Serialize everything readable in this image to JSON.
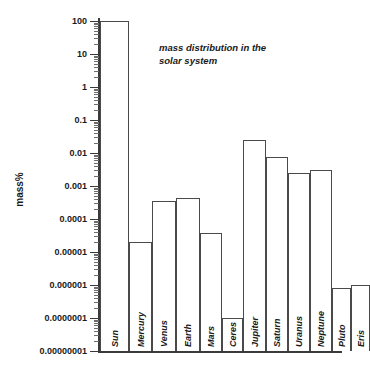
{
  "chart_data": {
    "type": "bar",
    "title": "mass distribution in the solar system",
    "title_line1": "mass distribution in the",
    "title_line2": "solar system",
    "xlabel": "",
    "ylabel": "mass%",
    "yscale": "log",
    "ylim": [
      1e-08,
      100
    ],
    "grid": false,
    "legend": "none",
    "ytick_labels": [
      "100",
      "10",
      "1",
      "0.1",
      "0.01",
      "0.001",
      "0.0001",
      "0.00001",
      "0.000001",
      "0.0000001",
      "0.00000001"
    ],
    "ytick_values": [
      100,
      10,
      1,
      0.1,
      0.01,
      0.001,
      0.0001,
      1e-05,
      1e-06,
      1e-07,
      1e-08
    ],
    "categories": [
      "Sun",
      "Mercury",
      "Venus",
      "Earth",
      "Mars",
      "Ceres",
      "Jupiter",
      "Saturn",
      "Uranus",
      "Neptune",
      "Pluto",
      "Eris"
    ],
    "values": [
      100,
      1.7e-05,
      0.00025,
      0.0003,
      3.2e-05,
      4.7e-07,
      0.095,
      0.028,
      0.0044,
      0.0052,
      7e-07,
      9e-07
    ],
    "bars": [
      {
        "label": "Sun",
        "value": 100,
        "left": 100,
        "width": 29,
        "top": 21
      },
      {
        "label": "Mercury",
        "value": 1.7e-05,
        "left": 129,
        "width": 23,
        "top": 242
      },
      {
        "label": "Venus",
        "value": 0.00025,
        "left": 152,
        "width": 24,
        "top": 201
      },
      {
        "label": "Earth",
        "value": 0.0003,
        "left": 176,
        "width": 24,
        "top": 198
      },
      {
        "label": "Mars",
        "value": 3.2e-05,
        "left": 200,
        "width": 22,
        "top": 233
      },
      {
        "label": "Ceres",
        "value": 4.7e-07,
        "left": 222,
        "width": 21,
        "top": 318
      },
      {
        "label": "Jupiter",
        "value": 0.095,
        "left": 243,
        "width": 23,
        "top": 140
      },
      {
        "label": "Saturn",
        "value": 0.028,
        "left": 266,
        "width": 22,
        "top": 157
      },
      {
        "label": "Uranus",
        "value": 0.0044,
        "left": 288,
        "width": 22,
        "top": 173
      },
      {
        "label": "Neptune",
        "value": 0.0052,
        "left": 310,
        "width": 22,
        "top": 170
      },
      {
        "label": "Pluto",
        "value": 7e-07,
        "left": 332,
        "width": 19,
        "top": 288
      },
      {
        "label": "Eris",
        "value": 9e-07,
        "left": 351,
        "width": 19,
        "top": 285
      }
    ],
    "colors": {
      "axis": "#3a3a3a",
      "bar_outline": "#4a4a4a",
      "bar_fill": "#ffffff",
      "text": "#1a1a1a",
      "background": "#ffffff"
    }
  }
}
